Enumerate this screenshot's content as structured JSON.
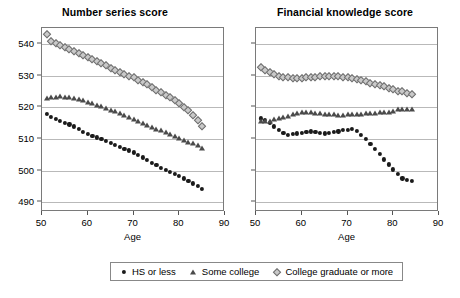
{
  "figure": {
    "xlabel": "Age",
    "legend": {
      "position": "bottom-center",
      "entries": [
        {
          "label": "HS or less",
          "marker": "filled-circle",
          "color": "#1a1a1a"
        },
        {
          "label": "Some college",
          "marker": "triangle",
          "color": "#4a4a4a"
        },
        {
          "label": "College graduate or more",
          "marker": "diamond",
          "color": "#c9c9c9"
        }
      ]
    }
  },
  "chart_data": [
    {
      "type": "scatter",
      "title": "Number series score",
      "xlabel": "Age",
      "ylabel": "",
      "xlim": [
        50,
        90
      ],
      "ylim": [
        487,
        545
      ],
      "xticks": [
        50,
        60,
        70,
        80,
        90
      ],
      "yticks": [
        490,
        500,
        510,
        520,
        530,
        540
      ],
      "grid": "horizontal",
      "x": [
        51,
        52,
        53,
        54,
        55,
        56,
        57,
        58,
        59,
        60,
        61,
        62,
        63,
        64,
        65,
        66,
        67,
        68,
        69,
        70,
        71,
        72,
        73,
        74,
        75,
        76,
        77,
        78,
        79,
        80,
        81,
        82,
        83,
        84,
        85
      ],
      "series": [
        {
          "name": "HS or less",
          "marker": "filled-circle",
          "values": [
            518.0,
            517.0,
            516.4,
            515.8,
            515.2,
            514.6,
            514.0,
            513.2,
            512.3,
            511.6,
            511.0,
            510.5,
            510.0,
            509.4,
            508.8,
            508.2,
            507.6,
            507.0,
            506.4,
            505.8,
            505.0,
            504.2,
            503.4,
            502.6,
            501.8,
            501.0,
            500.2,
            499.6,
            499.0,
            498.4,
            497.6,
            496.8,
            496.0,
            495.2,
            494.4
          ]
        },
        {
          "name": "Some college",
          "marker": "triangle",
          "values": [
            523.0,
            523.2,
            523.4,
            523.5,
            523.4,
            523.2,
            523.0,
            522.6,
            522.2,
            521.8,
            521.3,
            520.8,
            520.3,
            519.8,
            519.3,
            518.7,
            518.1,
            517.5,
            516.9,
            516.3,
            515.7,
            515.1,
            514.5,
            513.9,
            513.3,
            512.7,
            512.1,
            511.5,
            511.0,
            510.4,
            509.8,
            509.2,
            508.6,
            508.0,
            507.3
          ]
        },
        {
          "name": "College graduate or more",
          "marker": "diamond",
          "values": [
            543.0,
            541.0,
            540.2,
            539.6,
            539.0,
            538.4,
            537.8,
            537.2,
            536.6,
            536.0,
            535.3,
            534.6,
            533.9,
            533.2,
            532.5,
            531.8,
            531.1,
            530.5,
            530.0,
            529.4,
            528.7,
            528.0,
            527.2,
            526.4,
            525.6,
            524.8,
            524.0,
            523.2,
            522.4,
            521.4,
            520.2,
            519.0,
            517.6,
            516.0,
            514.2
          ]
        }
      ]
    },
    {
      "type": "scatter",
      "title": "Financial knowledge score",
      "xlabel": "Age",
      "ylabel": "",
      "xlim": [
        50,
        90
      ],
      "ylim": [
        487,
        545
      ],
      "xticks": [
        50,
        60,
        70,
        80,
        90
      ],
      "yticks": [
        490,
        500,
        510,
        520,
        530,
        540
      ],
      "grid": "horizontal",
      "x": [
        51,
        52,
        53,
        54,
        55,
        56,
        57,
        58,
        59,
        60,
        61,
        62,
        63,
        64,
        65,
        66,
        67,
        68,
        69,
        70,
        71,
        72,
        73,
        74,
        75,
        76,
        77,
        78,
        79,
        80,
        81,
        82,
        83,
        84
      ],
      "series": [
        {
          "name": "HS or less",
          "marker": "filled-circle",
          "values": [
            516.5,
            516.0,
            515.2,
            514.0,
            513.0,
            512.0,
            511.4,
            511.5,
            511.8,
            512.0,
            512.2,
            512.4,
            512.3,
            512.0,
            511.8,
            512.0,
            512.2,
            512.4,
            512.8,
            513.0,
            513.2,
            512.6,
            511.4,
            510.0,
            508.4,
            506.8,
            505.2,
            503.6,
            502.0,
            500.4,
            499.0,
            497.6,
            497.0,
            496.8
          ]
        },
        {
          "name": "Some college",
          "marker": "triangle",
          "values": [
            515.6,
            515.6,
            515.8,
            516.2,
            516.6,
            517.0,
            517.4,
            517.8,
            518.2,
            518.5,
            518.6,
            518.5,
            518.3,
            518.1,
            518.0,
            517.9,
            517.8,
            517.7,
            517.7,
            517.8,
            517.8,
            517.9,
            518.0,
            518.1,
            518.2,
            518.3,
            518.4,
            518.5,
            518.6,
            518.8,
            519.4,
            519.6,
            519.6,
            519.6
          ]
        },
        {
          "name": "College graduate or more",
          "marker": "diamond",
          "values": [
            532.6,
            531.8,
            531.0,
            530.4,
            530.0,
            529.6,
            529.4,
            529.3,
            529.2,
            529.3,
            529.5,
            529.6,
            529.7,
            529.8,
            529.9,
            530.0,
            529.9,
            529.8,
            529.6,
            529.4,
            529.2,
            529.0,
            528.6,
            528.2,
            527.8,
            527.4,
            527.0,
            526.6,
            526.2,
            525.8,
            525.2,
            525.0,
            524.6,
            524.2
          ]
        }
      ]
    }
  ]
}
